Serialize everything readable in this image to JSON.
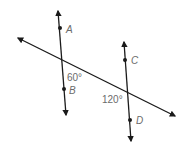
{
  "diagram": {
    "type": "parallel lines cut by transversal",
    "line_color": "#1a1a1a",
    "label_color": "#6b6b6b",
    "lines": [
      {
        "name": "AB",
        "points": [
          "A",
          "B"
        ]
      },
      {
        "name": "CD",
        "points": [
          "C",
          "D"
        ]
      },
      {
        "name": "transversal"
      }
    ],
    "points": {
      "A": "A",
      "B": "B",
      "C": "C",
      "D": "D"
    },
    "angles": {
      "angle_at_AB": "60°",
      "angle_at_CD": "120°"
    }
  }
}
